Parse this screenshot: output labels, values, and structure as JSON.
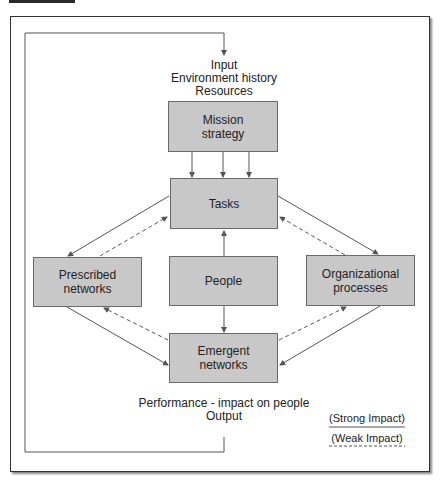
{
  "diagram": {
    "input_labels": [
      "Input",
      "Environment history",
      "Resources"
    ],
    "output_labels": [
      "Performance - impact on people",
      "Output"
    ],
    "boxes": {
      "mission": "Mission strategy",
      "tasks": "Tasks",
      "prescribed": "Prescribed networks",
      "people": "People",
      "organizational": "Organizational processes",
      "emergent": "Emergent networks"
    },
    "legend": {
      "strong": "(Strong Impact)",
      "weak": "(Weak Impact)"
    },
    "colors": {
      "box_fill": "#c8c8c8",
      "box_border": "#6a6a6a",
      "line": "#555555"
    }
  }
}
